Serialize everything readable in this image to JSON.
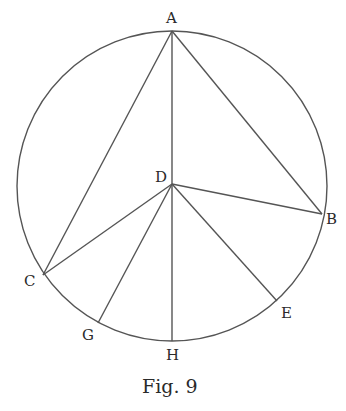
{
  "figure": {
    "caption": "Fig. 9",
    "circle": {
      "center": "D",
      "cx": 172,
      "cy": 186,
      "r": 155
    },
    "points": {
      "A": {
        "label": "A",
        "x": 172,
        "y": 31
      },
      "B": {
        "label": "B",
        "x": 322,
        "y": 214
      },
      "C": {
        "label": "C",
        "x": 43,
        "y": 275
      },
      "D": {
        "label": "D",
        "x": 172,
        "y": 184
      },
      "E": {
        "label": "E",
        "x": 277,
        "y": 301
      },
      "G": {
        "label": "G",
        "x": 98,
        "y": 323
      },
      "H": {
        "label": "H",
        "x": 172,
        "y": 341
      }
    },
    "segments": [
      [
        "A",
        "C"
      ],
      [
        "A",
        "B"
      ],
      [
        "A",
        "H"
      ],
      [
        "D",
        "B"
      ],
      [
        "D",
        "C"
      ],
      [
        "D",
        "G"
      ],
      [
        "D",
        "E"
      ]
    ]
  }
}
